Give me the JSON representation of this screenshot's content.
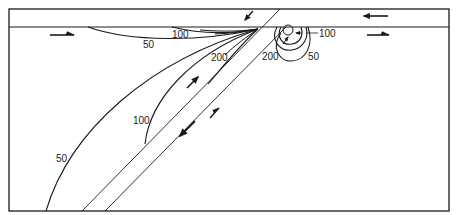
{
  "figure": {
    "contour_labels": {
      "left_50_surface": "50",
      "left_100_surface": "100",
      "left_200": "200",
      "left_100_deep": "100",
      "left_50_deep": "50",
      "right_100": "100",
      "right_200": "200",
      "right_50": "50"
    },
    "arrows": [
      {
        "id": "surface-left-right",
        "direction": "right"
      },
      {
        "id": "upper-layer-left",
        "direction": "left"
      },
      {
        "id": "surface-right-right",
        "direction": "right"
      },
      {
        "id": "slab-top-down-left",
        "direction": "down-left"
      },
      {
        "id": "slab-up-right-upper",
        "direction": "up-right"
      },
      {
        "id": "slab-down-left-lower",
        "direction": "down-left"
      },
      {
        "id": "slab-up-right-lower",
        "direction": "up-right"
      }
    ],
    "colors": {
      "line": "#1a1a1a",
      "background": "#ffffff"
    }
  }
}
